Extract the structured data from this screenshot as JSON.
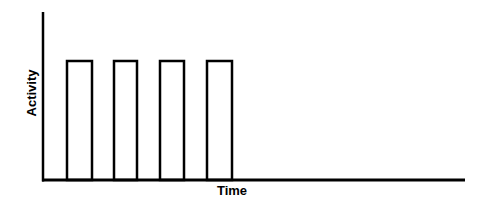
{
  "chart_data": {
    "type": "bar",
    "title": "",
    "xlabel": "Time",
    "ylabel": "Activity",
    "categories": [
      "1",
      "2",
      "3",
      "4"
    ],
    "values": [
      1,
      1,
      1,
      1
    ],
    "ylim": [
      0,
      1.4
    ],
    "grid": false,
    "legend": null,
    "style": "outlined rectangular pulses on time axis, no tick labels",
    "colors": {
      "stroke": "#000000",
      "fill": "#ffffff"
    },
    "geometry": {
      "origin": [
        43,
        180
      ],
      "y_axis_top": 12,
      "x_axis_right": 465,
      "bar_top": 61,
      "bars": [
        {
          "x0": 67,
          "x1": 92
        },
        {
          "x0": 114,
          "x1": 137
        },
        {
          "x0": 160,
          "x1": 184
        },
        {
          "x0": 207,
          "x1": 232
        }
      ]
    }
  }
}
